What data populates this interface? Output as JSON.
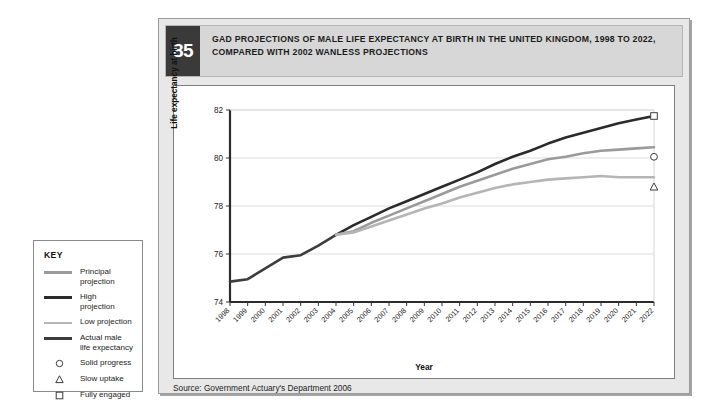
{
  "figure": {
    "number": "85",
    "title": "GAD PROJECTIONS OF MALE LIFE EXPECTANCY AT BIRTH IN THE UNITED KINGDOM, 1998 TO 2022, COMPARED WITH 2002 WANLESS PROJECTIONS",
    "source": "Source: Government Actuary's Department 2006"
  },
  "key": {
    "title": "KEY",
    "items": [
      {
        "label": "Principal projection",
        "type": "line",
        "color": "#9a9a9a",
        "weight": "thick"
      },
      {
        "label": "High projection",
        "type": "line",
        "color": "#2b2b2b",
        "weight": "thick"
      },
      {
        "label": "Low projection",
        "type": "line",
        "color": "#b5b5b5",
        "weight": "thin"
      },
      {
        "label": "Actual male life expectancy",
        "type": "line",
        "color": "#3d3d3d",
        "weight": "thick"
      },
      {
        "label": "Solid progress",
        "type": "marker",
        "marker": "circle-marker",
        "color": "#3d3d3d"
      },
      {
        "label": "Slow uptake",
        "type": "marker",
        "marker": "triangle-marker",
        "color": "#3d3d3d"
      },
      {
        "label": "Fully engaged",
        "type": "marker",
        "marker": "square-marker",
        "color": "#3d3d3d"
      }
    ]
  },
  "chart_data": {
    "type": "line",
    "title": "GAD projections of male life expectancy at birth in the United Kingdom, 1998 to 2022, compared with 2002 Wanless projections",
    "xlabel": "Year",
    "ylabel": "Life expectancy at birth",
    "xlim": [
      1998,
      2022
    ],
    "ylim": [
      74,
      82
    ],
    "yticks": [
      74,
      76,
      78,
      80,
      82
    ],
    "grid": "horizontal",
    "legend_position": "external-left",
    "x": [
      1998,
      1999,
      2000,
      2001,
      2002,
      2003,
      2004,
      2005,
      2006,
      2007,
      2008,
      2009,
      2010,
      2011,
      2012,
      2013,
      2014,
      2015,
      2016,
      2017,
      2018,
      2019,
      2020,
      2021,
      2022
    ],
    "xticklabels": [
      "1998",
      "1999",
      "2000",
      "2001",
      "2002",
      "2003",
      "2004",
      "2005",
      "2006",
      "2007",
      "2008",
      "2009",
      "2010",
      "2011",
      "2012",
      "2013",
      "2014",
      "2015",
      "2016",
      "2017",
      "2018",
      "2019",
      "2020",
      "2021",
      "2022"
    ],
    "series": [
      {
        "name": "Actual male life expectancy",
        "color": "#3d3d3d",
        "width": 2.6,
        "x": [
          1998,
          1999,
          2000,
          2001,
          2002,
          2003,
          2004
        ],
        "values": [
          74.85,
          74.95,
          75.4,
          75.85,
          75.95,
          76.35,
          76.8
        ]
      },
      {
        "name": "High projection",
        "color": "#2b2b2b",
        "width": 2.6,
        "x": [
          2004,
          2005,
          2006,
          2007,
          2008,
          2009,
          2010,
          2011,
          2012,
          2013,
          2014,
          2015,
          2016,
          2017,
          2018,
          2019,
          2020,
          2021,
          2022
        ],
        "values": [
          76.8,
          77.2,
          77.55,
          77.9,
          78.2,
          78.5,
          78.8,
          79.1,
          79.4,
          79.75,
          80.05,
          80.3,
          80.6,
          80.85,
          81.05,
          81.25,
          81.45,
          81.6,
          81.75
        ]
      },
      {
        "name": "Principal projection",
        "color": "#9a9a9a",
        "width": 2.6,
        "x": [
          2004,
          2005,
          2006,
          2007,
          2008,
          2009,
          2010,
          2011,
          2012,
          2013,
          2014,
          2015,
          2016,
          2017,
          2018,
          2019,
          2020,
          2021,
          2022
        ],
        "values": [
          76.8,
          76.95,
          77.3,
          77.6,
          77.9,
          78.2,
          78.5,
          78.8,
          79.05,
          79.3,
          79.55,
          79.75,
          79.95,
          80.05,
          80.2,
          80.3,
          80.35,
          80.4,
          80.45
        ]
      },
      {
        "name": "Low projection",
        "color": "#b5b5b5",
        "width": 2.6,
        "x": [
          2004,
          2005,
          2006,
          2007,
          2008,
          2009,
          2010,
          2011,
          2012,
          2013,
          2014,
          2015,
          2016,
          2017,
          2018,
          2019,
          2020,
          2021,
          2022
        ],
        "values": [
          76.8,
          76.9,
          77.15,
          77.4,
          77.65,
          77.9,
          78.1,
          78.35,
          78.55,
          78.75,
          78.9,
          79.0,
          79.1,
          79.15,
          79.2,
          79.25,
          79.2,
          79.2,
          79.2
        ]
      }
    ],
    "markers": [
      {
        "name": "Fully engaged",
        "shape": "square-marker",
        "x": 2022,
        "y": 81.75
      },
      {
        "name": "Solid progress",
        "shape": "circle-marker",
        "x": 2022,
        "y": 80.05
      },
      {
        "name": "Slow uptake",
        "shape": "triangle-marker",
        "x": 2022,
        "y": 78.8
      }
    ]
  }
}
